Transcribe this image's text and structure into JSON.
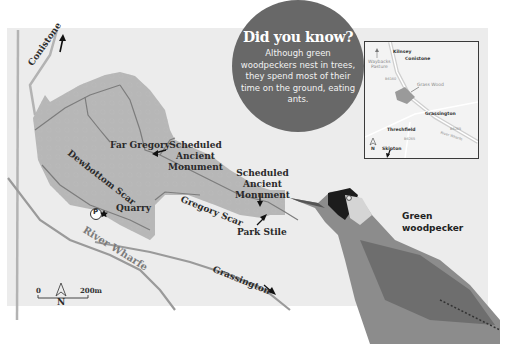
{
  "callout": {
    "title": "Did you know?",
    "body": "Although green woodpeckers nest in trees, they spend most of their time on the ground, eating ants.",
    "color": "#686868"
  },
  "map": {
    "labels": {
      "conistone": "Conistone",
      "far_gregory": "Far Gregory",
      "sam1": "Scheduled Ancient Monument",
      "sam1_l1": "Scheduled",
      "sam1_l2": "Ancient",
      "sam1_l3": "Monument",
      "sam2_l1": "Scheduled",
      "sam2_l2": "Ancient",
      "sam2_l3": "Monument",
      "dewbottom_scar": "Dewbottom Scar",
      "gregory_scar": "Gregory Scar",
      "quarry": "Quarry",
      "park_stile": "Park Stile",
      "river_wharfe": "River Wharfe",
      "grassington": "Grassington",
      "parking": "P"
    },
    "north": "N",
    "scale": {
      "start": "0",
      "end": "200m"
    }
  },
  "inset": {
    "labels": {
      "kilnsey": "Kilnsey",
      "conistone": "Conistone",
      "wayback": "Waybacks",
      "pasture": "Pasture",
      "grass_wood": "Grass Wood",
      "b6160_a": "B6160",
      "grassington": "Grassington",
      "threshfield": "Threshfield",
      "b6265_a": "B6265",
      "b6265_b": "B6265",
      "river_wharfe": "River Wharfe",
      "skipton": "Skipton",
      "north": "N"
    }
  },
  "bird": {
    "label_l1": "Green",
    "label_l2": "woodpecker"
  }
}
